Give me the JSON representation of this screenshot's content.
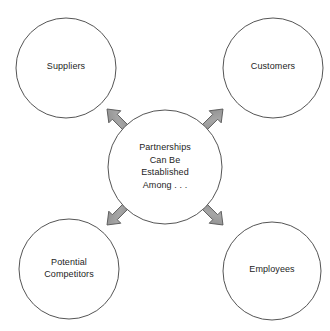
{
  "diagram": {
    "type": "hub-and-spoke",
    "title": "Partnerships Can Be Established Among . . .",
    "background_color": "#ffffff",
    "node_stroke_color": "#555555",
    "node_fill_color": "#ffffff",
    "arrow_fill_color": "#9a9a9a",
    "arrow_stroke_color": "#5a5a5a",
    "text_color": "#1d1d1d",
    "center": {
      "id": "center",
      "lines": [
        "Partnerships",
        "Can Be",
        "Established",
        "Among . . ."
      ],
      "cx": 165,
      "cy": 167,
      "r": 57
    },
    "nodes": [
      {
        "id": "suppliers",
        "lines": [
          "Suppliers"
        ],
        "position": "top-left",
        "cx": 66,
        "cy": 68,
        "r": 50
      },
      {
        "id": "customers",
        "lines": [
          "Customers"
        ],
        "position": "top-right",
        "cx": 273,
        "cy": 68,
        "r": 50
      },
      {
        "id": "potential-competitors",
        "lines": [
          "Potential",
          "Competitors"
        ],
        "position": "bottom-left",
        "cx": 69,
        "cy": 269,
        "r": 50
      },
      {
        "id": "employees",
        "lines": [
          "Employees"
        ],
        "position": "bottom-right",
        "cx": 272,
        "cy": 271,
        "r": 49
      }
    ],
    "arrows": [
      {
        "id": "arrow-to-suppliers",
        "from": "center",
        "to": "suppliers",
        "direction": "up-left"
      },
      {
        "id": "arrow-to-customers",
        "from": "center",
        "to": "customers",
        "direction": "up-right"
      },
      {
        "id": "arrow-to-potential-competitors",
        "from": "center",
        "to": "potential-competitors",
        "direction": "down-left"
      },
      {
        "id": "arrow-to-employees",
        "from": "center",
        "to": "employees",
        "direction": "down-right"
      }
    ]
  }
}
